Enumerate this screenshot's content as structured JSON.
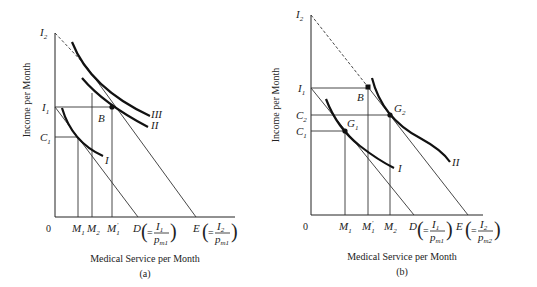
{
  "figures": [
    {
      "id": "a",
      "caption": "(a)",
      "xlabel": "Medical Service per Month",
      "ylabel": "Income per Month",
      "origin": "0",
      "y_labels": {
        "I2": "I",
        "I2_sub": "2",
        "I1": "I",
        "I1_sub": "1",
        "C1": "C",
        "C1_sub": "1"
      },
      "x_labels": {
        "M1": "M",
        "M1_sub": "1",
        "M2": "M",
        "M2_sub": "2",
        "M1p": "M",
        "M1p_sub": "1",
        "M1p_prime": "′",
        "D": "D",
        "D_eq": "=",
        "D_num": "I",
        "D_num_sub": "1",
        "D_den": "p",
        "D_den_sub": "m1",
        "E": "E",
        "E_eq": "=",
        "E_num": "I",
        "E_num_sub": "2",
        "E_den": "p",
        "E_den_sub": "m1"
      },
      "points": {
        "B": "B"
      },
      "curves": {
        "I": "I",
        "II": "II",
        "III": "III"
      }
    },
    {
      "id": "b",
      "caption": "(b)",
      "xlabel": "Medical Service per Month",
      "ylabel": "Income per Month",
      "origin": "0",
      "y_labels": {
        "I2": "I",
        "I2_sub": "2",
        "I1": "I",
        "I1_sub": "1",
        "C2": "C",
        "C2_sub": "2",
        "C1": "C",
        "C1_sub": "1"
      },
      "x_labels": {
        "M1": "M",
        "M1_sub": "1",
        "M1p": "M",
        "M1p_sub": "1",
        "M1p_prime": "′",
        "M2": "M",
        "M2_sub": "2",
        "D": "D",
        "D_eq": "=",
        "D_num": "I",
        "D_num_sub": "1",
        "D_den": "p",
        "D_den_sub": "m1",
        "E": "E",
        "E_eq": "=",
        "E_num": "I",
        "E_num_sub": "2",
        "E_den": "p",
        "E_den_sub": "m2"
      },
      "points": {
        "B": "B",
        "G1": "G",
        "G1_sub": "1",
        "G2": "G",
        "G2_sub": "2"
      },
      "curves": {
        "I": "I",
        "II": "II"
      }
    }
  ]
}
